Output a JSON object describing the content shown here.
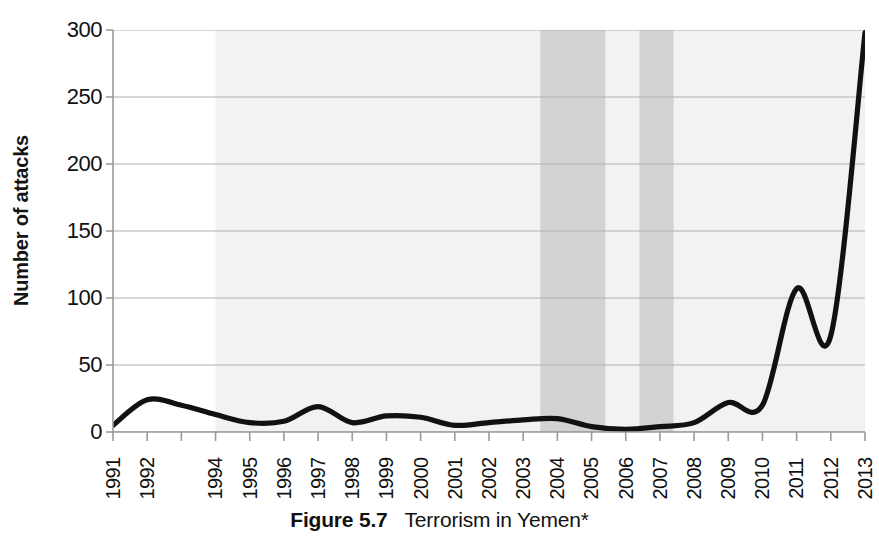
{
  "figure": {
    "number_label": "Figure 5.7",
    "title_text": "Terrorism in Yemen*"
  },
  "axes": {
    "y_title": "Number of attacks",
    "y_ticks": [
      "0",
      "50",
      "100",
      "150",
      "200",
      "250",
      "300"
    ],
    "x_ticks": [
      "1991",
      "1992",
      "",
      "1994",
      "1995",
      "1996",
      "1997",
      "1998",
      "1999",
      "2000",
      "2001",
      "2002",
      "2003",
      "2004",
      "2005",
      "2006",
      "2007",
      "2008",
      "2009",
      "2010",
      "2011",
      "2012",
      "2013"
    ]
  },
  "colors": {
    "line": "#111111",
    "gridline": "#b0b0b0",
    "axis": "#9a9a9a",
    "band_light": "#f2f2f2",
    "band_dark": "#d2d2d2",
    "background": "#ffffff",
    "text": "#111111"
  },
  "chart_data": {
    "type": "line",
    "title": "Terrorism in Yemen*",
    "xlabel": "",
    "ylabel": "Number of attacks",
    "xlim": [
      1991,
      2013
    ],
    "ylim": [
      0,
      300
    ],
    "ytick_values": [
      0,
      50,
      100,
      150,
      200,
      250,
      300
    ],
    "grid": true,
    "legend": "none",
    "categories": [
      1991,
      1992,
      1993,
      1994,
      1995,
      1996,
      1997,
      1998,
      1999,
      2000,
      2001,
      2002,
      2003,
      2004,
      2005,
      2006,
      2007,
      2008,
      2009,
      2010,
      2011,
      2012,
      2013
    ],
    "series": [
      {
        "name": "Number of attacks",
        "values": [
          5,
          24,
          20,
          13,
          7,
          8,
          19,
          7,
          12,
          11,
          5,
          7,
          9,
          10,
          4,
          2,
          4,
          7,
          22,
          20,
          107,
          72,
          298
        ]
      }
    ],
    "annotations": {
      "shaded_bands": [
        {
          "name": "light-band",
          "from": 1994.0,
          "to": 2013.0,
          "color": "#f2f2f2"
        },
        {
          "name": "dark-band-1",
          "from": 2003.5,
          "to": 2005.4,
          "color": "#d2d2d2"
        },
        {
          "name": "dark-band-2",
          "from": 2006.4,
          "to": 2007.4,
          "color": "#d2d2d2"
        }
      ]
    },
    "footnote_marker": "*"
  },
  "curve": {
    "path_points": [
      {
        "x": 1991.0,
        "y": 5
      },
      {
        "x": 1992.0,
        "y": 24
      },
      {
        "x": 1993.0,
        "y": 20
      },
      {
        "x": 1994.0,
        "y": 13
      },
      {
        "x": 1995.0,
        "y": 7
      },
      {
        "x": 1996.0,
        "y": 8
      },
      {
        "x": 1997.0,
        "y": 19
      },
      {
        "x": 1998.0,
        "y": 7
      },
      {
        "x": 1999.0,
        "y": 12
      },
      {
        "x": 2000.0,
        "y": 11
      },
      {
        "x": 2001.0,
        "y": 5
      },
      {
        "x": 2002.0,
        "y": 7
      },
      {
        "x": 2003.0,
        "y": 9
      },
      {
        "x": 2004.0,
        "y": 10
      },
      {
        "x": 2005.0,
        "y": 4
      },
      {
        "x": 2006.0,
        "y": 2
      },
      {
        "x": 2007.0,
        "y": 4
      },
      {
        "x": 2008.0,
        "y": 7
      },
      {
        "x": 2009.0,
        "y": 22
      },
      {
        "x": 2010.0,
        "y": 20
      },
      {
        "x": 2011.0,
        "y": 107
      },
      {
        "x": 2012.0,
        "y": 72
      },
      {
        "x": 2013.0,
        "y": 298
      }
    ]
  }
}
